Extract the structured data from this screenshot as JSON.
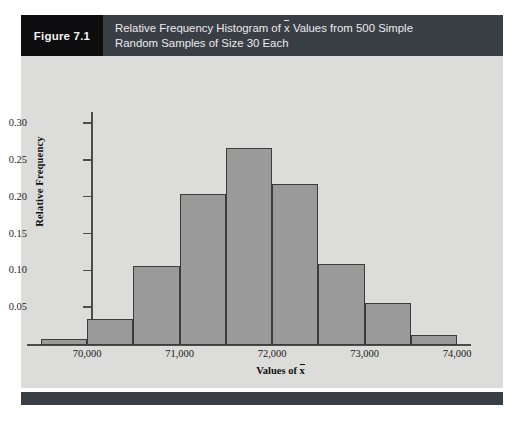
{
  "figure": {
    "number_label": "Figure 7.1",
    "title_line1_pre": "Relative Frequency Histogram of ",
    "title_xbar": "x",
    "title_line1_post": " Values from 500 Simple",
    "title_line2": "Random Samples of Size 30 Each",
    "title_full": "Relative Frequency Histogram of x̄ Values from 500 Simple Random Samples of Size 30 Each",
    "header_bg": "#3a3f46",
    "number_bg": "#0d0d0f",
    "panel_bg": "#dcdcda",
    "bar_fill": "#9a9a9a",
    "bar_stroke": "#3c3c3c"
  },
  "chart_data": {
    "type": "bar",
    "xlabel_pre": "Values of ",
    "xlabel_xbar": "x",
    "xlabel": "Values of x̄",
    "ylabel": "Relative Frequency",
    "xlim": [
      69350,
      74150
    ],
    "ylim": [
      0,
      0.315
    ],
    "grid": false,
    "legend": "none",
    "bin_width": 500,
    "bin_edges": [
      69500,
      70000,
      70500,
      71000,
      71500,
      72000,
      72500,
      73000,
      73500,
      74000
    ],
    "categories": [
      "69,500–70,000",
      "70,000–70,500",
      "70,500–71,000",
      "71,000–71,500",
      "71,500–72,000",
      "72,000–72,500",
      "72,500–73,000",
      "73,000–73,500",
      "73,500–74,000"
    ],
    "values": [
      0.008,
      0.035,
      0.107,
      0.205,
      0.267,
      0.218,
      0.11,
      0.057,
      0.013
    ],
    "x_ticks": [
      70000,
      71000,
      72000,
      73000,
      74000
    ],
    "x_tick_labels": [
      "70,000",
      "71,000",
      "72,000",
      "73,000",
      "74,000"
    ],
    "y_ticks": [
      0.05,
      0.1,
      0.15,
      0.2,
      0.25,
      0.3
    ],
    "y_tick_labels": [
      "0.05",
      "0.10",
      "0.15",
      "0.20",
      "0.25",
      "0.30"
    ]
  }
}
